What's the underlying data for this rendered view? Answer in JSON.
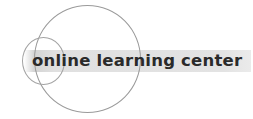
{
  "logo": {
    "title": "online learning center",
    "icon": "overlapping-circles-icon",
    "colors": {
      "text": "#2a2a2a",
      "band": "#e0e0e0",
      "circle_stroke": "#9a9a9a",
      "background": "#ffffff"
    }
  }
}
